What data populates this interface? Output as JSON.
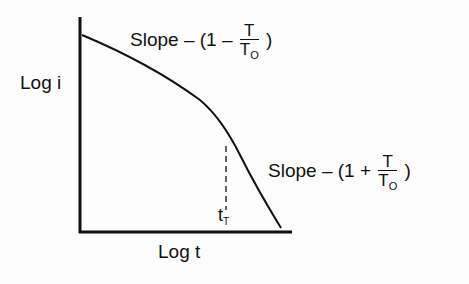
{
  "diagram": {
    "y_axis_label": "Log i",
    "x_axis_label": "Log t",
    "upper_slope": {
      "prefix": "Slope",
      "dash": "–",
      "open": "(1",
      "op": "–",
      "num": "T",
      "den_main": "T",
      "den_sub": "O",
      "close": ")"
    },
    "lower_slope": {
      "prefix": "Slope",
      "dash": "–",
      "open": "(1",
      "op": "+",
      "num": "T",
      "den_main": "T",
      "den_sub": "O",
      "close": ")"
    },
    "transition_label_main": "t",
    "transition_label_sub": "T"
  },
  "colors": {
    "ink": "#111111",
    "background": "#fdfdfd"
  }
}
